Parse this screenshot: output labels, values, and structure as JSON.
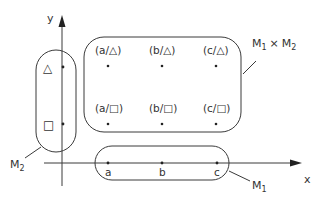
{
  "diagram": {
    "axes": {
      "x_label": "x",
      "y_label": "y"
    },
    "sets": {
      "m1": {
        "label": "M",
        "subscript": "1",
        "elements": [
          "a",
          "b",
          "c"
        ]
      },
      "m2": {
        "label": "M",
        "subscript": "2",
        "elements": [
          "△",
          "□"
        ]
      },
      "product": {
        "label_part1": "M",
        "sub1": "1",
        "times": "×",
        "label_part2": "M",
        "sub2": "2",
        "elements": [
          [
            "(a/△)",
            "(b/△)",
            "(c/△)"
          ],
          [
            "(a/□)",
            "(b/□)",
            "(c/□)"
          ]
        ]
      }
    },
    "colors": {
      "stroke": "#3a3a3a",
      "text": "#333333",
      "background": "#ffffff"
    }
  }
}
